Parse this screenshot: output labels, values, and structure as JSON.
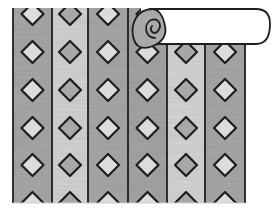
{
  "illustration": {
    "subject": "striped wallpaper with diamond pattern, top-right corner rolled up like a scroll",
    "background": "#ffffff",
    "outline_color": "#1e1e1e",
    "panel": {
      "left": 13,
      "top": 8,
      "right": 245,
      "bottom": 203
    },
    "stripes": [
      {
        "x0": 13,
        "x1": 52,
        "fill": "#a9a9a9",
        "diamond_fill": "#dcdcdc"
      },
      {
        "x0": 52,
        "x1": 88,
        "fill": "#d4d4d4",
        "diamond_fill": "#a8a8a8"
      },
      {
        "x0": 88,
        "x1": 128,
        "fill": "#a9a9a9",
        "diamond_fill": "#dcdcdc"
      },
      {
        "x0": 128,
        "x1": 167,
        "fill": "#a6a6a6",
        "diamond_fill": "#dcdcdc"
      },
      {
        "x0": 167,
        "x1": 205,
        "fill": "#d6d6d6",
        "diamond_fill": "#a8a8a8"
      },
      {
        "x0": 205,
        "x1": 245,
        "fill": "#a9a9a9",
        "diamond_fill": "#dcdcdc"
      }
    ],
    "diamond_rows_y": [
      14,
      52,
      90,
      128,
      165,
      203
    ],
    "diamond_half_size": 11,
    "scroll": {
      "x0": 131,
      "y0": 8,
      "x1": 270,
      "y1": 48,
      "paper_fill": "#ffffff",
      "curl_fill": "#a9a9a9"
    }
  }
}
